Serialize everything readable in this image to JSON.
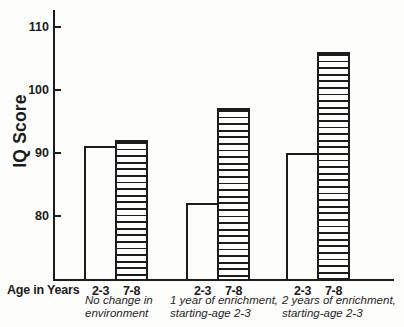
{
  "figure": {
    "background": "#fdfdfb",
    "ink_color": "#1c1c1c"
  },
  "chart_data": {
    "type": "bar",
    "title": "",
    "ylabel": "IQ Score",
    "xlabel": "Age in Years",
    "ylim": [
      70,
      113
    ],
    "yticks": [
      80,
      90,
      100,
      110
    ],
    "grid": false,
    "legend_position": "none",
    "bar_patterns": {
      "2-3": "plain",
      "7-8": "striped"
    },
    "groups": [
      {
        "caption_lines": [
          "No change in",
          "environment"
        ],
        "bars": [
          {
            "age": "2-3",
            "value": 91,
            "fill": "plain"
          },
          {
            "age": "7-8",
            "value": 92,
            "fill": "striped"
          }
        ]
      },
      {
        "caption_lines": [
          "1 year of enrichment,",
          "starting-age 2-3"
        ],
        "bars": [
          {
            "age": "2-3",
            "value": 82,
            "fill": "plain"
          },
          {
            "age": "7-8",
            "value": 97,
            "fill": "striped"
          }
        ]
      },
      {
        "caption_lines": [
          "2 years of enrichment,",
          "starting-age 2-3"
        ],
        "bars": [
          {
            "age": "2-3",
            "value": 90,
            "fill": "plain"
          },
          {
            "age": "7-8",
            "value": 106,
            "fill": "striped"
          }
        ]
      }
    ]
  }
}
